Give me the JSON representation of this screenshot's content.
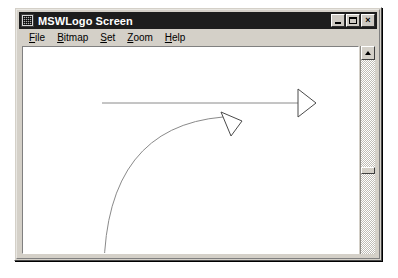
{
  "window": {
    "title": "MSWLogo Screen",
    "icon": "mswlogo-app-icon",
    "buttons": {
      "minimize": "minimize-button",
      "maximize": "maximize-button",
      "close_glyph": "×"
    }
  },
  "menu": {
    "items": [
      {
        "label": "File",
        "accel": "F",
        "rest": "ile"
      },
      {
        "label": "Bitmap",
        "accel": "B",
        "rest": "itmap"
      },
      {
        "label": "Set",
        "accel": "S",
        "rest": "et"
      },
      {
        "label": "Zoom",
        "accel": "Z",
        "rest": "oom"
      },
      {
        "label": "Help",
        "accel": "H",
        "rest": "elp"
      }
    ]
  },
  "canvas": {
    "background": "#ffffff",
    "pen_color": "#808080",
    "drawing": {
      "straight_line": {
        "name": "horizontal-pen-line",
        "from": [
          79,
          56
        ],
        "to": [
          275,
          56
        ]
      },
      "arc": {
        "name": "quarter-arc-pen-path",
        "start": [
          81,
          222
        ],
        "end": [
          200,
          70
        ],
        "control": [
          83,
          80
        ]
      },
      "turtles": [
        {
          "name": "turtle-right",
          "heading_degrees": 90,
          "points": "275,42 275,70 293,56"
        },
        {
          "name": "turtle-arc-end",
          "heading_degrees": 150,
          "points": "198,65 219,74 208,89"
        }
      ]
    }
  },
  "scrollbar": {
    "name": "vertical-scrollbar",
    "up_arrow": "scroll-up-arrow-icon",
    "thumb_position_percent": 58
  },
  "colors": {
    "window_face": "#d4d0c8",
    "titlebar": "#1d1d1d",
    "titlebar_text": "#ffffff",
    "pen": "#808080"
  }
}
